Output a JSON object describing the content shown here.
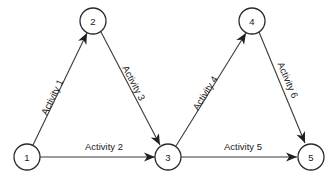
{
  "diagram": {
    "type": "activity-on-arrow-network",
    "background_color": "#ffffff",
    "line_color": "#3a3a3a",
    "node_stroke_color": "#2b2b2b",
    "node_fill_color": "#ffffff",
    "text_color": "#1a1a1a",
    "arrow_color": "#1f1f1f",
    "nodes": [
      {
        "id": "1",
        "label": "1",
        "cx": 27,
        "cy": 157,
        "r": 13
      },
      {
        "id": "2",
        "label": "2",
        "cx": 93,
        "cy": 21,
        "r": 13
      },
      {
        "id": "3",
        "label": "3",
        "cx": 168,
        "cy": 157,
        "r": 13
      },
      {
        "id": "4",
        "label": "4",
        "cx": 252,
        "cy": 21,
        "r": 13
      },
      {
        "id": "5",
        "label": "5",
        "cx": 311,
        "cy": 157,
        "r": 13
      }
    ],
    "edges": [
      {
        "id": "activity-1",
        "label": "Activity 1",
        "from": "1",
        "to": "2",
        "x1": 33,
        "y1": 145,
        "x2": 87,
        "y2": 33,
        "label_x": 52,
        "label_y": 97,
        "label_rotation": -64,
        "orientation": "diagonal-up-right"
      },
      {
        "id": "activity-2",
        "label": "Activity 2",
        "from": "1",
        "to": "3",
        "x1": 40,
        "y1": 157,
        "x2": 155,
        "y2": 157,
        "label_x": 104,
        "label_y": 146,
        "label_rotation": 0,
        "orientation": "horizontal"
      },
      {
        "id": "activity-3",
        "label": "Activity 3",
        "from": "2",
        "to": "3",
        "x1": 101,
        "y1": 32,
        "x2": 160,
        "y2": 145,
        "label_x": 134,
        "label_y": 83,
        "label_rotation": 62,
        "orientation": "diagonal-down-right"
      },
      {
        "id": "activity-4",
        "label": "Activity 4",
        "from": "3",
        "to": "4",
        "x1": 176,
        "y1": 146,
        "x2": 246,
        "y2": 33,
        "label_x": 205,
        "label_y": 93,
        "label_rotation": -58,
        "orientation": "diagonal-up-right"
      },
      {
        "id": "activity-5",
        "label": "Activity 5",
        "from": "3",
        "to": "5",
        "x1": 181,
        "y1": 157,
        "x2": 297,
        "y2": 157,
        "label_x": 243,
        "label_y": 146,
        "label_rotation": 0,
        "orientation": "horizontal"
      },
      {
        "id": "activity-6",
        "label": "Activity 6",
        "from": "4",
        "to": "5",
        "x1": 259,
        "y1": 32,
        "x2": 305,
        "y2": 143,
        "label_x": 288,
        "label_y": 80,
        "label_rotation": 67,
        "orientation": "diagonal-down-right"
      }
    ],
    "arrowheads": [
      {
        "id": "arrow-to-2",
        "edge": "activity-1",
        "x": 87,
        "y": 33,
        "angle": -64
      },
      {
        "id": "arrow-to-3-from-1",
        "edge": "activity-2",
        "x": 155,
        "y": 157,
        "angle": 0
      },
      {
        "id": "arrow-to-3-from-2",
        "edge": "activity-3",
        "x": 160,
        "y": 145,
        "angle": 62
      },
      {
        "id": "arrow-to-4",
        "edge": "activity-4",
        "x": 246,
        "y": 33,
        "angle": -58
      },
      {
        "id": "arrow-to-5-from-3",
        "edge": "activity-5",
        "x": 297,
        "y": 157,
        "angle": 0
      },
      {
        "id": "arrow-to-5-from-4",
        "edge": "activity-6",
        "x": 305,
        "y": 143,
        "angle": 67
      }
    ]
  }
}
